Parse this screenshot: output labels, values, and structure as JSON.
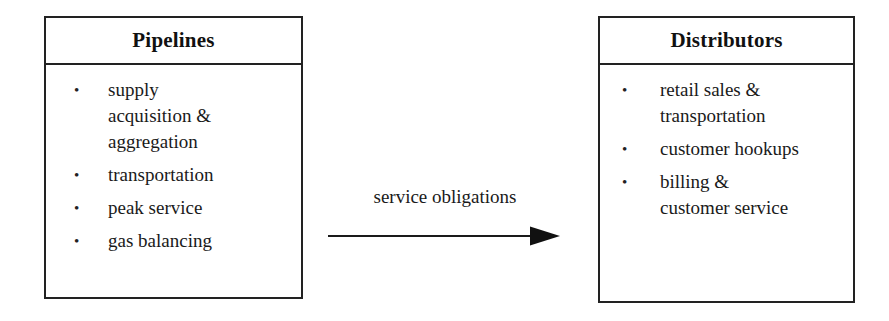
{
  "diagram": {
    "type": "flow-diagram",
    "title": "",
    "background_color": "#ffffff",
    "line_color": "#222222",
    "text_color": "#1a1a1a",
    "boxes": [
      {
        "id": "pipelines",
        "title": "Pipelines",
        "bullet_marker": "•",
        "items": [
          "supply\nacquisition &\naggregation",
          "transportation",
          "peak service",
          "gas balancing"
        ]
      },
      {
        "id": "distributors",
        "title": "Distributors",
        "bullet_marker": "•",
        "items": [
          "retail sales &\ntransportation",
          "customer hookups",
          "billing &\ncustomer service"
        ]
      }
    ],
    "connector": {
      "label": "service obligations",
      "from": "pipelines",
      "to": "distributors",
      "direction": "right",
      "arrowhead": "solid-triangle"
    }
  }
}
